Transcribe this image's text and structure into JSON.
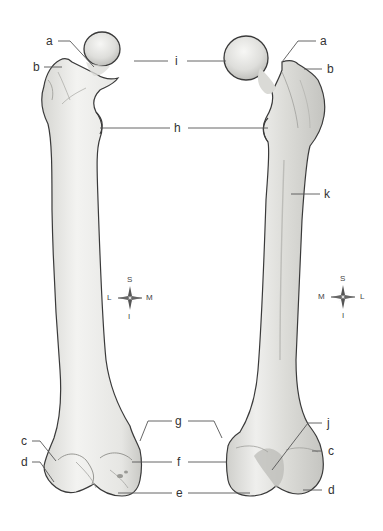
{
  "figure": {
    "left_view": "anterior",
    "right_view": "posterior",
    "colors": {
      "bone_fill": "#e9e9e6",
      "bone_shadow": "#c8c8c4",
      "bone_outline": "#3a3a3a",
      "leader_line": "#555555",
      "label_text": "#333333",
      "background": "#ffffff"
    }
  },
  "labels": {
    "a_left": "a",
    "b_left": "b",
    "i_center": "i",
    "h_center": "h",
    "a_right": "a",
    "b_right": "b",
    "k_right": "k",
    "c_left": "c",
    "d_left": "d",
    "g_center": "g",
    "f_center": "f",
    "e_center": "e",
    "j_right": "j",
    "c_right": "c",
    "d_right": "d"
  },
  "compass_left": {
    "top": "S",
    "bottom": "I",
    "left": "L",
    "right": "M"
  },
  "compass_right": {
    "top": "S",
    "bottom": "I",
    "left": "M",
    "right": "L"
  }
}
